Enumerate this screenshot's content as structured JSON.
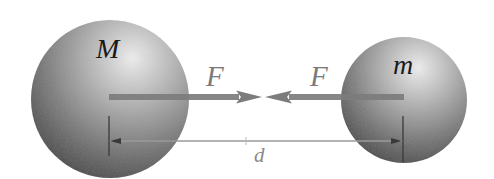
{
  "diagram": {
    "colors": {
      "background": "#ffffff",
      "sphere_highlight": "#ececec",
      "sphere_mid": "#9a9a9a",
      "sphere_shadow": "#474747",
      "force_arrow": "#7c7c7c",
      "dimension_line": "#9a9a9a",
      "tick_line": "#3a3a3a",
      "mass_label": "#1a1a1a",
      "force_label": "#7a7a7a"
    },
    "large_mass": {
      "label": "M",
      "center": [
        110,
        99
      ],
      "radius": 79
    },
    "small_mass": {
      "label": "m",
      "center": [
        404,
        100
      ],
      "radius": 63
    },
    "forces": [
      {
        "label": "F",
        "direction": "right",
        "from_x": 109,
        "to_x": 262,
        "y": 97
      },
      {
        "label": "F",
        "direction": "left",
        "from_x": 404,
        "to_x": 265,
        "y": 97
      }
    ],
    "distance": {
      "label": "d",
      "from_x": 109,
      "to_x": 403,
      "y": 141
    }
  }
}
